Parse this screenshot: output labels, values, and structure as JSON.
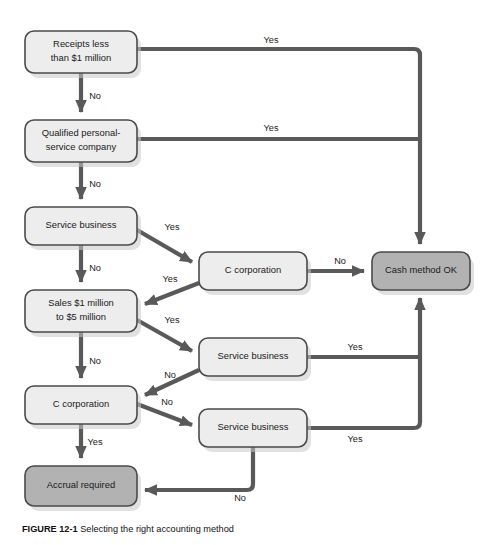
{
  "figure": {
    "caption_number": "FIGURE 12-1",
    "caption_text": "Selecting the right accounting method",
    "background_color": "#ffffff",
    "line_color": "#595959",
    "light_node_fill": "#ededed",
    "shaded_node_fill": "#b2b2b2",
    "node_border_color": "#4a4a4a"
  },
  "nodes": [
    {
      "id": "receipts",
      "label_line1": "Receipts less",
      "label_line2": "than $1 million",
      "style": "light",
      "x": 25,
      "y": 31,
      "w": 112,
      "h": 42
    },
    {
      "id": "qualified",
      "label_line1": "Qualified personal-",
      "label_line2": "service company",
      "style": "light",
      "x": 25,
      "y": 120,
      "w": 112,
      "h": 42
    },
    {
      "id": "service_top",
      "label_line1": "Service business",
      "label_line2": "",
      "style": "light",
      "x": 25,
      "y": 207,
      "w": 112,
      "h": 38
    },
    {
      "id": "sales_range",
      "label_line1": "Sales $1 million",
      "label_line2": "to $5 million",
      "style": "light",
      "x": 25,
      "y": 290,
      "w": 112,
      "h": 42
    },
    {
      "id": "c_corp_left",
      "label_line1": "C corporation",
      "label_line2": "",
      "style": "light",
      "x": 25,
      "y": 386,
      "w": 112,
      "h": 38
    },
    {
      "id": "accrual",
      "label_line1": "Accrual required",
      "label_line2": "",
      "style": "shaded",
      "x": 25,
      "y": 466,
      "w": 112,
      "h": 40
    },
    {
      "id": "c_corp_mid",
      "label_line1": "C corporation",
      "label_line2": "",
      "style": "light",
      "x": 199,
      "y": 252,
      "w": 108,
      "h": 38
    },
    {
      "id": "service_mid",
      "label_line1": "Service business",
      "label_line2": "",
      "style": "light",
      "x": 199,
      "y": 338,
      "w": 108,
      "h": 38
    },
    {
      "id": "service_bottom",
      "label_line1": "Service business",
      "label_line2": "",
      "style": "light",
      "x": 199,
      "y": 409,
      "w": 108,
      "h": 38
    },
    {
      "id": "cash_ok",
      "label_line1": "Cash method OK",
      "label_line2": "",
      "style": "shaded",
      "x": 372,
      "y": 252,
      "w": 98,
      "h": 38
    }
  ],
  "edges": [
    {
      "id": "receipts-yes-cash",
      "label": "Yes",
      "from": "receipts",
      "to": "cash_ok",
      "label_x": 271,
      "label_y": 41
    },
    {
      "id": "receipts-no-qualified",
      "label": "No",
      "from": "receipts",
      "to": "qualified",
      "label_x": 95,
      "label_y": 97
    },
    {
      "id": "qualified-yes-cash",
      "label": "Yes",
      "from": "qualified",
      "to": "cash_ok",
      "label_x": 271,
      "label_y": 129
    },
    {
      "id": "qualified-no-service",
      "label": "No",
      "from": "qualified",
      "to": "service_top",
      "label_x": 95,
      "label_y": 185
    },
    {
      "id": "servicetop-yes-ccorp",
      "label": "Yes",
      "from": "service_top",
      "to": "c_corp_mid",
      "label_x": 172,
      "label_y": 228
    },
    {
      "id": "servicetop-no-sales",
      "label": "No",
      "from": "service_top",
      "to": "sales_range",
      "label_x": 95,
      "label_y": 269
    },
    {
      "id": "ccorpmid-no-cash",
      "label": "No",
      "from": "c_corp_mid",
      "to": "cash_ok",
      "label_x": 340,
      "label_y": 262
    },
    {
      "id": "ccorpmid-yes-sales",
      "label": "Yes",
      "from": "c_corp_mid",
      "to": "sales_range",
      "label_x": 170,
      "label_y": 280
    },
    {
      "id": "sales-yes-servicemid",
      "label": "Yes",
      "from": "sales_range",
      "to": "service_mid",
      "label_x": 172,
      "label_y": 321
    },
    {
      "id": "sales-no-ccorpleft",
      "label": "No",
      "from": "sales_range",
      "to": "c_corp_left",
      "label_x": 95,
      "label_y": 362
    },
    {
      "id": "servicemid-yes-cash",
      "label": "Yes",
      "from": "service_mid",
      "to": "cash_ok",
      "label_x": 355,
      "label_y": 348
    },
    {
      "id": "servicemid-no-ccorpleft",
      "label": "No",
      "from": "service_mid",
      "to": "c_corp_left",
      "label_x": 170,
      "label_y": 376
    },
    {
      "id": "ccorpleft-no-servicebot",
      "label": "No",
      "from": "c_corp_left",
      "to": "service_bottom",
      "label_x": 167,
      "label_y": 403
    },
    {
      "id": "ccorpleft-yes-accrual",
      "label": "Yes",
      "from": "c_corp_left",
      "to": "accrual",
      "label_x": 95,
      "label_y": 443
    },
    {
      "id": "servicebot-yes-cash",
      "label": "Yes",
      "from": "service_bottom",
      "to": "cash_ok",
      "label_x": 355,
      "label_y": 440
    },
    {
      "id": "servicebot-no-accrual",
      "label": "No",
      "from": "service_bottom",
      "to": "accrual",
      "label_x": 240,
      "label_y": 499
    }
  ]
}
